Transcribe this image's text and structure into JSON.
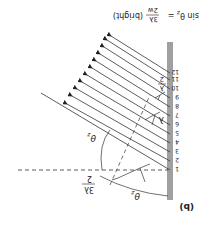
{
  "figure": {
    "panel_label": "(b)",
    "formula": {
      "lhs": "sin θ",
      "sub": "z",
      "eq": "=",
      "num": "3λ",
      "den": "2w",
      "note": "(bright)"
    },
    "sources": [
      "1",
      "2",
      "3",
      "4",
      "5",
      "6",
      "7",
      "8",
      "9",
      "10",
      "11",
      "12"
    ],
    "labels": {
      "theta_z_upper": "θ",
      "theta_z_lower": "θ",
      "z_sub": "z",
      "lambda": "λ",
      "lambda_half_num": "λ",
      "lambda_half_den": "2",
      "three_lambda_half_num": "3λ",
      "three_lambda_half_den": "2"
    },
    "colors": {
      "slit": "#a0a0a0",
      "line": "#333333"
    },
    "orientation": "rotated 180°"
  }
}
